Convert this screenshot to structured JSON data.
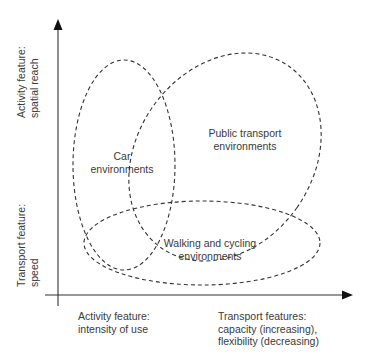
{
  "diagram": {
    "type": "overlapping-ellipses",
    "y_axis": {
      "upper_label": [
        "Activity feature:",
        "spatial reach"
      ],
      "lower_label": [
        "Transport feature:",
        "speed"
      ]
    },
    "x_axis": {
      "left_label": [
        "Activity feature:",
        "intensity of use"
      ],
      "right_label": [
        "Transport features:",
        "capacity (increasing),",
        "flexibility (decreasing)"
      ]
    },
    "regions": {
      "car": [
        "Car",
        "environments"
      ],
      "public_transport": [
        "Public transport",
        "environments"
      ],
      "walking_cycling": [
        "Walking and cycling",
        "environments"
      ]
    },
    "colors": {
      "axis": "#333333",
      "dash": "#333333",
      "text": "#3a3a3a",
      "background": "#ffffff"
    }
  }
}
